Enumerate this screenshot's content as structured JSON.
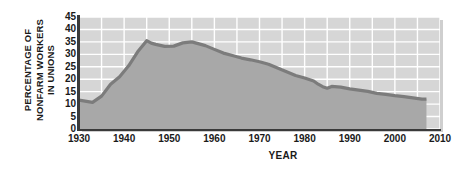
{
  "chart_data": {
    "type": "area",
    "title": "",
    "xlabel": "YEAR",
    "ylabel": "PERCENTAGE OF NONFARM WORKERS IN UNIONS",
    "ylabel_line1": "PERCENTAGE OF",
    "ylabel_line2": "NONFARM WORKERS",
    "ylabel_line3": "IN UNIONS",
    "xlim": [
      1930,
      2010
    ],
    "ylim": [
      0,
      45
    ],
    "xticks": [
      1930,
      1940,
      1950,
      1960,
      1970,
      1980,
      1990,
      2000,
      2010
    ],
    "xtick_labels": [
      "1930",
      "1940",
      "1950",
      "1960",
      "1970",
      "1980",
      "1990",
      "2000",
      "2010"
    ],
    "yticks": [
      0,
      5,
      10,
      15,
      20,
      25,
      30,
      35,
      40,
      45
    ],
    "ytick_labels": [
      "0",
      "5",
      "10",
      "15",
      "20",
      "25",
      "30",
      "35",
      "40",
      "45"
    ],
    "x_minor_step": 5,
    "y_minor_step": 5,
    "grid": true,
    "legend": "none",
    "series": [
      {
        "name": "Percentage of nonfarm workers in unions",
        "x": [
          1930,
          1932,
          1933,
          1935,
          1937,
          1939,
          1941,
          1943,
          1945,
          1946,
          1947,
          1949,
          1951,
          1953,
          1955,
          1956,
          1958,
          1960,
          1962,
          1964,
          1966,
          1968,
          1970,
          1972,
          1974,
          1976,
          1978,
          1980,
          1982,
          1983,
          1984,
          1985,
          1986,
          1988,
          1990,
          1992,
          1994,
          1996,
          1998,
          2000,
          2002,
          2004,
          2006,
          2007
        ],
        "y": [
          11.6,
          11.0,
          10.7,
          13.2,
          18.0,
          21.0,
          25.4,
          31.0,
          35.5,
          34.5,
          34.0,
          33.2,
          33.3,
          34.6,
          35.0,
          34.5,
          33.5,
          32.0,
          30.5,
          29.5,
          28.5,
          27.8,
          27.0,
          26.0,
          24.5,
          23.0,
          21.5,
          20.5,
          19.3,
          18.0,
          17.0,
          16.4,
          17.1,
          16.8,
          16.1,
          15.6,
          15.1,
          14.3,
          13.9,
          13.4,
          13.0,
          12.5,
          12.0,
          12.0
        ]
      }
    ],
    "annotations": [],
    "colors": {
      "line": "#7c7c7c",
      "fill_under": "#a8a8a8",
      "plot_bg": "#d6d6d6",
      "grid": "#ffffff",
      "axis": "#3a3a3a",
      "text": "#1a1a1a",
      "shadow": "#cfcfcf"
    }
  }
}
